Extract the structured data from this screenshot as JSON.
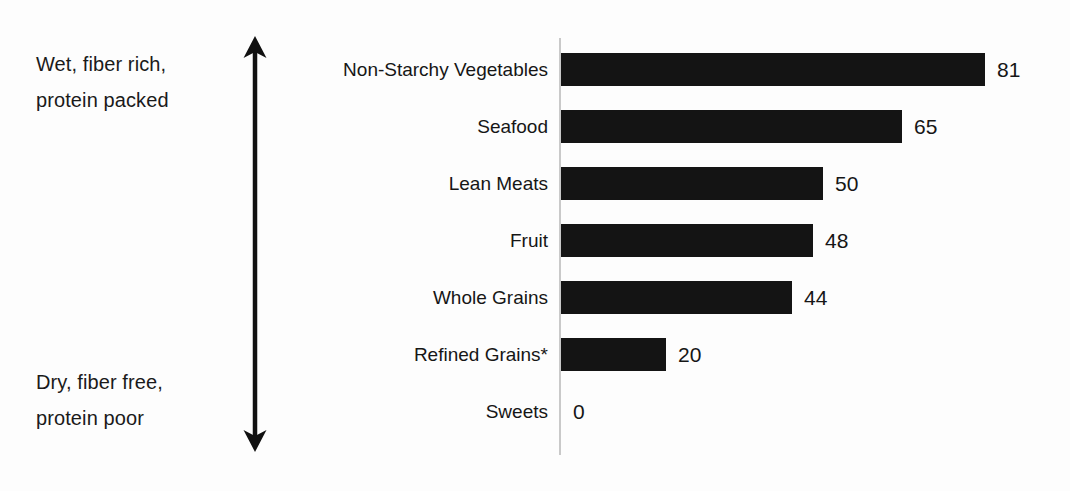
{
  "annotations": {
    "top": {
      "line1": "Wet, fiber rich,",
      "line2": "protein packed"
    },
    "bottom": {
      "line1": "Dry, fiber free,",
      "line2": "protein poor"
    },
    "arrow_icon": "double-headed-vertical-arrow-icon"
  },
  "chart_data": {
    "type": "bar",
    "orientation": "horizontal",
    "title": "",
    "xlabel": "",
    "ylabel": "",
    "grid": false,
    "legend": null,
    "xlim": [
      0,
      81
    ],
    "categories": [
      "Non-Starchy Vegetables",
      "Seafood",
      "Lean Meats",
      "Fruit",
      "Whole Grains",
      "Refined Grains*",
      "Sweets"
    ],
    "values": [
      81,
      65,
      50,
      48,
      44,
      20,
      0
    ],
    "value_labels": [
      "81",
      "65",
      "50",
      "48",
      "44",
      "20",
      "0"
    ],
    "annotations": [
      "Wet, fiber rich, protein packed",
      "Dry, fiber free, protein poor"
    ],
    "colors": {
      "bar": "#141414",
      "axis": "#c9c9c9",
      "text": "#161616",
      "background": "#fdfdfd"
    }
  }
}
